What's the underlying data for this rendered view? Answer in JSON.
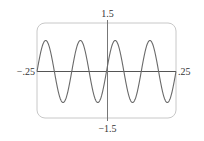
{
  "chart_data": {
    "type": "line",
    "title": "",
    "xlabel": "",
    "ylabel": "",
    "function": "y = sin(16*pi*x)",
    "xlim": [
      -0.25,
      0.25
    ],
    "ylim": [
      -1.5,
      1.5
    ],
    "grid": false,
    "legend": null,
    "tick_labels": {
      "x_min": "−.25",
      "x_max": ".25",
      "y_max": "1.5",
      "y_min": "−1.5"
    },
    "series": [
      {
        "name": "sine",
        "amplitude": 1,
        "period": 0.125,
        "cycles_shown": 4,
        "x": [
          -0.25,
          -0.21875,
          -0.1875,
          -0.15625,
          -0.125,
          -0.09375,
          -0.0625,
          -0.03125,
          0,
          0.03125,
          0.0625,
          0.09375,
          0.125,
          0.15625,
          0.1875,
          0.21875,
          0.25
        ],
        "y": [
          0,
          1,
          0,
          -1,
          0,
          1,
          0,
          -1,
          0,
          1,
          0,
          -1,
          0,
          1,
          0,
          -1,
          0
        ]
      }
    ]
  },
  "colors": {
    "frame": "#c8c8c8",
    "axes": "#555555",
    "curve": "#6a6a6a",
    "label": "#333333"
  }
}
